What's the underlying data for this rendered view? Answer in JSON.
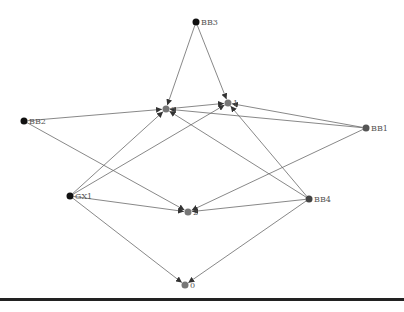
{
  "graph": {
    "nodes": [
      {
        "id": "BB3",
        "label": "BB3",
        "x": 196,
        "y": 22,
        "color": "#111111",
        "labelPos": "right"
      },
      {
        "id": "3",
        "label": "3",
        "x": 166,
        "y": 109,
        "color": "#777777",
        "labelPos": "right"
      },
      {
        "id": "1",
        "label": "1",
        "x": 228,
        "y": 103,
        "color": "#777777",
        "labelPos": "right"
      },
      {
        "id": "BB2",
        "label": "BB2",
        "x": 24,
        "y": 121,
        "color": "#111111",
        "labelPos": "right"
      },
      {
        "id": "BB1",
        "label": "BB1",
        "x": 366,
        "y": 128,
        "color": "#555555",
        "labelPos": "right"
      },
      {
        "id": "GX1",
        "label": "GX1",
        "x": 70,
        "y": 196,
        "color": "#111111",
        "labelPos": "right"
      },
      {
        "id": "BB4",
        "label": "BB4",
        "x": 309,
        "y": 199,
        "color": "#444444",
        "labelPos": "right"
      },
      {
        "id": "2",
        "label": "2",
        "x": 188,
        "y": 212,
        "color": "#777777",
        "labelPos": "right"
      },
      {
        "id": "0",
        "label": "0",
        "x": 185,
        "y": 285,
        "color": "#777777",
        "labelPos": "right"
      }
    ],
    "edges": [
      {
        "from": "BB3",
        "to": "3"
      },
      {
        "from": "BB3",
        "to": "1"
      },
      {
        "from": "BB2",
        "to": "3"
      },
      {
        "from": "BB2",
        "to": "2"
      },
      {
        "from": "3",
        "to": "1"
      },
      {
        "from": "BB1",
        "to": "1"
      },
      {
        "from": "BB1",
        "to": "3"
      },
      {
        "from": "BB1",
        "to": "2"
      },
      {
        "from": "GX1",
        "to": "3"
      },
      {
        "from": "GX1",
        "to": "1"
      },
      {
        "from": "GX1",
        "to": "2"
      },
      {
        "from": "GX1",
        "to": "0"
      },
      {
        "from": "BB4",
        "to": "3"
      },
      {
        "from": "BB4",
        "to": "1"
      },
      {
        "from": "BB4",
        "to": "2"
      },
      {
        "from": "BB4",
        "to": "0"
      }
    ],
    "edge_color": "#6a6a6a",
    "node_radius": 3.5
  }
}
